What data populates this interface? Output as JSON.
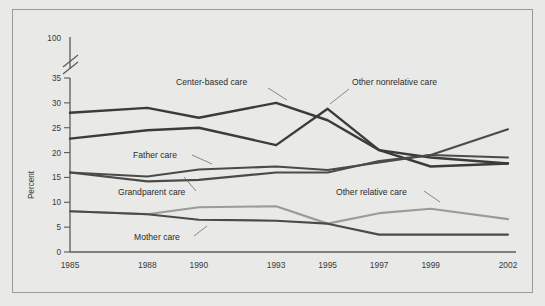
{
  "figure": {
    "background_color": "#e9e9e7",
    "frame_color": "#9a9a97"
  },
  "axes": {
    "ylabel": "Percent",
    "y_ticks": [
      "0",
      "5",
      "10",
      "15",
      "20",
      "25",
      "30",
      "35",
      "100"
    ],
    "x_ticks": [
      "1985",
      "1988",
      "1990",
      "1993",
      "1995",
      "1997",
      "1999",
      "2002"
    ],
    "axis_break": true
  },
  "series_labels": {
    "center": "Center-based care",
    "nonrelative": "Other nonrelative care",
    "father": "Father care",
    "grandparent": "Grandparent care",
    "relative": "Other relative care",
    "mother": "Mother care"
  },
  "chart_data": {
    "type": "line",
    "title": "",
    "xlabel": "",
    "ylabel": "Percent",
    "x": [
      1985,
      1988,
      1990,
      1993,
      1995,
      1997,
      1999,
      2002
    ],
    "categories": [
      "1985",
      "1988",
      "1990",
      "1993",
      "1995",
      "1997",
      "1999",
      "2002"
    ],
    "ylim": [
      0,
      35
    ],
    "y_ticks": [
      0,
      5,
      10,
      15,
      20,
      25,
      30,
      35
    ],
    "y_axis_break_top_label": 100,
    "grid": false,
    "legend": "inline-labels",
    "series": [
      {
        "name": "Center-based care",
        "color": "#3b3b39",
        "width": 2.4,
        "values": [
          28.0,
          29.0,
          27.0,
          30.0,
          26.5,
          20.5,
          19.0,
          17.8
        ]
      },
      {
        "name": "Other nonrelative care",
        "color": "#3b3b39",
        "width": 2.4,
        "values": [
          22.8,
          24.5,
          25.0,
          21.5,
          28.8,
          20.5,
          17.2,
          17.8
        ]
      },
      {
        "name": "Father care",
        "color": "#4a4a48",
        "width": 2.1,
        "values": [
          16.0,
          15.2,
          16.6,
          17.2,
          16.5,
          18.0,
          19.5,
          19.0
        ]
      },
      {
        "name": "Grandparent care",
        "color": "#4a4a48",
        "width": 2.1,
        "values": [
          16.0,
          14.2,
          14.5,
          16.0,
          16.0,
          18.3,
          19.5,
          24.7
        ]
      },
      {
        "name": "Other relative care",
        "color": "#9b9b98",
        "width": 2.2,
        "values": [
          8.2,
          7.6,
          9.0,
          9.2,
          5.7,
          7.8,
          8.7,
          6.6
        ]
      },
      {
        "name": "Mother care",
        "color": "#4a4a48",
        "width": 2.1,
        "values": [
          8.2,
          7.6,
          6.5,
          6.3,
          5.7,
          3.5,
          3.5,
          3.5
        ]
      }
    ]
  }
}
